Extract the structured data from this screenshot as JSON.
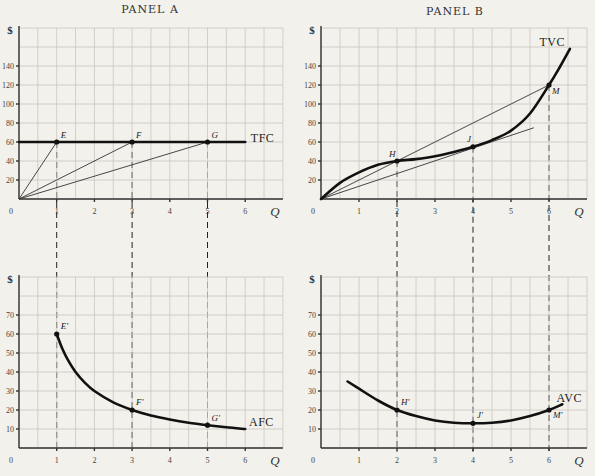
{
  "chart_data": [
    {
      "id": "panel-a",
      "type": "line",
      "title": "PANEL A",
      "xlabel": "Q",
      "ylabel": "$",
      "origin_label": "0",
      "x_ticks": [
        1,
        2,
        3,
        4,
        5,
        6
      ],
      "y_ticks": [
        20,
        40,
        60,
        80,
        100,
        120,
        140
      ],
      "xlim": [
        0,
        7
      ],
      "ylim": [
        0,
        180
      ],
      "grid": true,
      "series": [
        {
          "name": "TFC",
          "kind": "curve",
          "label_at": [
            6.15,
            60
          ],
          "points": [
            [
              0,
              60
            ],
            [
              6,
              60
            ]
          ]
        }
      ],
      "rays": [
        {
          "name": "ray-to-E",
          "points": [
            [
              0,
              0
            ],
            [
              1,
              60
            ]
          ]
        },
        {
          "name": "ray-to-F",
          "points": [
            [
              0,
              0
            ],
            [
              3,
              60
            ]
          ]
        },
        {
          "name": "ray-to-G",
          "points": [
            [
              0,
              0
            ],
            [
              5,
              60
            ]
          ]
        }
      ],
      "points": [
        {
          "label": "E",
          "x": 1,
          "y": 60,
          "dx": 4,
          "dy": -4
        },
        {
          "label": "F",
          "x": 3,
          "y": 60,
          "dx": 4,
          "dy": -4
        },
        {
          "label": "G",
          "x": 5,
          "y": 60,
          "dx": 4,
          "dy": -4
        }
      ],
      "dashed_x": [
        1,
        3,
        5
      ]
    },
    {
      "id": "panel-b",
      "type": "line",
      "title": "PANEL B",
      "xlabel": "Q",
      "ylabel": "$",
      "origin_label": "0",
      "x_ticks": [
        1,
        2,
        3,
        4,
        5,
        6
      ],
      "y_ticks": [
        20,
        40,
        60,
        80,
        100,
        120,
        140
      ],
      "xlim": [
        0,
        7
      ],
      "ylim": [
        0,
        180
      ],
      "grid": true,
      "series": [
        {
          "name": "TVC",
          "kind": "curve",
          "label_at": [
            5.75,
            161
          ],
          "points": [
            [
              0,
              0
            ],
            [
              0.5,
              17
            ],
            [
              1,
              28
            ],
            [
              1.5,
              36
            ],
            [
              2,
              40
            ],
            [
              2.5,
              42
            ],
            [
              3,
              45
            ],
            [
              3.5,
              49.5
            ],
            [
              4,
              55
            ],
            [
              4.5,
              62
            ],
            [
              5,
              72
            ],
            [
              5.5,
              90
            ],
            [
              6,
              120
            ],
            [
              6.3,
              140
            ],
            [
              6.55,
              158
            ]
          ]
        }
      ],
      "rays": [
        {
          "name": "ray-through-H-to-M",
          "points": [
            [
              0,
              0
            ],
            [
              6,
              120
            ]
          ]
        },
        {
          "name": "tangent-ray-through-J",
          "points": [
            [
              0,
              0
            ],
            [
              5.6,
              75
            ]
          ]
        }
      ],
      "points": [
        {
          "label": "H",
          "x": 2,
          "y": 40,
          "dx": -8,
          "dy": -4
        },
        {
          "label": "J",
          "x": 4,
          "y": 55,
          "dx": -6,
          "dy": -5
        },
        {
          "label": "M",
          "x": 6,
          "y": 120,
          "dx": 3,
          "dy": 9
        }
      ],
      "dashed_x": [
        2,
        4,
        6
      ]
    },
    {
      "id": "panel-c",
      "type": "line",
      "title": "",
      "xlabel": "Q",
      "ylabel": "$",
      "origin_label": "0",
      "x_ticks": [
        1,
        2,
        3,
        4,
        5,
        6
      ],
      "y_ticks": [
        10,
        20,
        30,
        40,
        50,
        60,
        70
      ],
      "xlim": [
        0,
        7
      ],
      "ylim": [
        0,
        90
      ],
      "grid": true,
      "series": [
        {
          "name": "AFC",
          "kind": "curve",
          "label_at": [
            6.1,
            11.5
          ],
          "points": [
            [
              1,
              60
            ],
            [
              1.15,
              52.2
            ],
            [
              1.3,
              46.2
            ],
            [
              1.5,
              40
            ],
            [
              1.75,
              34.3
            ],
            [
              2,
              30
            ],
            [
              2.5,
              24
            ],
            [
              3,
              20
            ],
            [
              3.5,
              17.1
            ],
            [
              4,
              15
            ],
            [
              4.5,
              13.3
            ],
            [
              5,
              12
            ],
            [
              5.5,
              10.9
            ],
            [
              6,
              10
            ]
          ]
        }
      ],
      "rays": [],
      "points": [
        {
          "label": "E'",
          "x": 1,
          "y": 60,
          "dx": 4,
          "dy": -5
        },
        {
          "label": "F'",
          "x": 3,
          "y": 20,
          "dx": 4,
          "dy": -5
        },
        {
          "label": "G'",
          "x": 5,
          "y": 12,
          "dx": 4,
          "dy": -4
        }
      ],
      "dashed_x": []
    },
    {
      "id": "panel-d",
      "type": "line",
      "title": "",
      "xlabel": "Q",
      "ylabel": "$",
      "origin_label": "0",
      "x_ticks": [
        1,
        2,
        3,
        4,
        5,
        6
      ],
      "y_ticks": [
        10,
        20,
        30,
        40,
        50,
        60,
        70
      ],
      "xlim": [
        0,
        7
      ],
      "ylim": [
        0,
        90
      ],
      "grid": true,
      "series": [
        {
          "name": "AVC",
          "kind": "curve",
          "label_at": [
            6.2,
            24
          ],
          "points": [
            [
              0.7,
              35
            ],
            [
              1,
              31.2
            ],
            [
              1.5,
              25
            ],
            [
              2,
              20
            ],
            [
              2.5,
              16.8
            ],
            [
              3,
              14.5
            ],
            [
              3.5,
              13.3
            ],
            [
              4,
              13
            ],
            [
              4.5,
              13.3
            ],
            [
              5,
              14.5
            ],
            [
              5.5,
              16.8
            ],
            [
              6,
              20
            ],
            [
              6.35,
              23
            ]
          ]
        }
      ],
      "rays": [],
      "points": [
        {
          "label": "H'",
          "x": 2,
          "y": 20,
          "dx": 4,
          "dy": -5
        },
        {
          "label": "J'",
          "x": 4,
          "y": 13,
          "dx": 4,
          "dy": -5
        },
        {
          "label": "M'",
          "x": 6,
          "y": 20,
          "dx": 4,
          "dy": 8
        }
      ],
      "dashed_x": []
    }
  ],
  "connectors": [
    {
      "name": "dashed-E",
      "x": 1,
      "from_panel": 0,
      "from_y": 60,
      "to_panel": 2,
      "to_y": -2
    },
    {
      "name": "dashed-F",
      "x": 3,
      "from_panel": 0,
      "from_y": 60,
      "to_panel": 2,
      "to_y": -2
    },
    {
      "name": "dashed-G",
      "x": 5,
      "from_panel": 0,
      "from_y": 60,
      "to_panel": 2,
      "to_y": -2
    },
    {
      "name": "dashed-H",
      "x": 2,
      "from_panel": 1,
      "from_y": 40,
      "to_panel": 3,
      "to_y": -2
    },
    {
      "name": "dashed-J",
      "x": 4,
      "from_panel": 1,
      "from_y": 55,
      "to_panel": 3,
      "to_y": -2
    },
    {
      "name": "dashed-M",
      "x": 6,
      "from_panel": 1,
      "from_y": 120,
      "to_panel": 3,
      "to_y": -2
    }
  ]
}
